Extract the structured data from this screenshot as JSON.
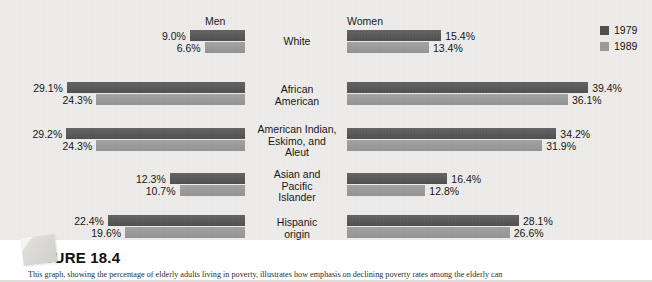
{
  "figure": {
    "title": "FIGURE 18.4",
    "caption": "This graph, showing the percentage of elderly adults living in poverty, illustrates how emphasis on declining poverty rates among the elderly can"
  },
  "colors": {
    "series_1979": "#5a5a5a",
    "series_1989": "#9b9b9b",
    "background": "#eeedeb",
    "text": "#141414"
  },
  "columns": {
    "left_label": "Men",
    "right_label": "Women"
  },
  "legend": {
    "items": [
      {
        "label": "1979",
        "swatch": "#4d4d4d"
      },
      {
        "label": "1989",
        "swatch": "#9b9b9b"
      }
    ]
  },
  "chart_data": {
    "type": "bar",
    "title": "FIGURE 18.4",
    "subtitle": "Percentage of elderly adults living in poverty",
    "xlabel": "",
    "ylabel": "",
    "orientation": "horizontal",
    "layout": "back-to-back paired panels (Men mirrored left, Women right)",
    "grid": false,
    "legend_position": "top-right",
    "value_unit": "%",
    "xlim": [
      0,
      40
    ],
    "panels": [
      "Men",
      "Women"
    ],
    "categories": [
      "White",
      "African American",
      "American Indian, Eskimo, and Aleut",
      "Asian and Pacific Islander",
      "Hispanic origin"
    ],
    "series": [
      {
        "name": "1979",
        "men": [
          9.0,
          29.1,
          29.2,
          12.3,
          22.4
        ],
        "women": [
          15.4,
          39.4,
          34.2,
          16.4,
          28.1
        ]
      },
      {
        "name": "1989",
        "men": [
          6.6,
          24.3,
          24.3,
          10.7,
          19.6
        ],
        "women": [
          13.4,
          36.1,
          31.9,
          12.8,
          26.6
        ]
      }
    ]
  },
  "rows": [
    {
      "label_lines": [
        "White"
      ],
      "top": 30,
      "height": 36,
      "men": [
        {
          "value": 9.0,
          "text": "9.0%",
          "series": "1979"
        },
        {
          "value": 6.6,
          "text": "6.6%",
          "series": "1989"
        }
      ],
      "women": [
        {
          "value": 15.4,
          "text": "15.4%",
          "series": "1979"
        },
        {
          "value": 13.4,
          "text": "13.4%",
          "series": "1989"
        }
      ],
      "label_top": 36
    },
    {
      "label_lines": [
        "African",
        "American"
      ],
      "top": 82,
      "height": 36,
      "men": [
        {
          "value": 29.1,
          "text": "29.1%",
          "series": "1979"
        },
        {
          "value": 24.3,
          "text": "24.3%",
          "series": "1989"
        }
      ],
      "women": [
        {
          "value": 39.4,
          "text": "39.4%",
          "series": "1979"
        },
        {
          "value": 36.1,
          "text": "36.1%",
          "series": "1989"
        }
      ],
      "label_top": 84
    },
    {
      "label_lines": [
        "American Indian,",
        "Eskimo, and",
        "Aleut"
      ],
      "top": 128,
      "height": 36,
      "men": [
        {
          "value": 29.2,
          "text": "29.2%",
          "series": "1979"
        },
        {
          "value": 24.3,
          "text": "24.3%",
          "series": "1989"
        }
      ],
      "women": [
        {
          "value": 34.2,
          "text": "34.2%",
          "series": "1979"
        },
        {
          "value": 31.9,
          "text": "31.9%",
          "series": "1989"
        }
      ],
      "label_top": 124
    },
    {
      "label_lines": [
        "Asian and",
        "Pacific",
        "Islander"
      ],
      "top": 173,
      "height": 36,
      "men": [
        {
          "value": 12.3,
          "text": "12.3%",
          "series": "1979"
        },
        {
          "value": 10.7,
          "text": "10.7%",
          "series": "1989"
        }
      ],
      "women": [
        {
          "value": 16.4,
          "text": "16.4%",
          "series": "1979"
        },
        {
          "value": 12.8,
          "text": "12.8%",
          "series": "1989"
        }
      ],
      "label_top": 169
    },
    {
      "label_lines": [
        "Hispanic",
        "origin"
      ],
      "top": 215,
      "height": 36,
      "men": [
        {
          "value": 22.4,
          "text": "22.4%",
          "series": "1979"
        },
        {
          "value": 19.6,
          "text": "19.6%",
          "series": "1989"
        }
      ],
      "women": [
        {
          "value": 28.1,
          "text": "28.1%",
          "series": "1979"
        },
        {
          "value": 26.6,
          "text": "26.6%",
          "series": "1989"
        }
      ],
      "label_top": 217
    }
  ]
}
